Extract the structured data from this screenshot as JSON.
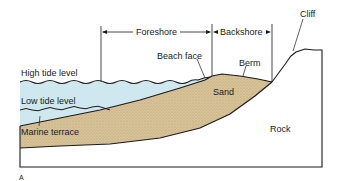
{
  "figure": {
    "panel_letter": "A",
    "zones": {
      "foreshore": "Foreshore",
      "backshore": "Backshore"
    },
    "labels": {
      "cliff": "Cliff",
      "beach_face": "Beach face",
      "berm": "Berm",
      "high_tide": "High tide level",
      "low_tide": "Low tide level",
      "sand": "Sand",
      "marine_terrace": "Marine terrace",
      "rock": "Rock"
    },
    "colors": {
      "water": "#cfe8f0",
      "sand": "#d9c49a",
      "rock": "#ffffff",
      "outline": "#1a1a1a"
    }
  }
}
